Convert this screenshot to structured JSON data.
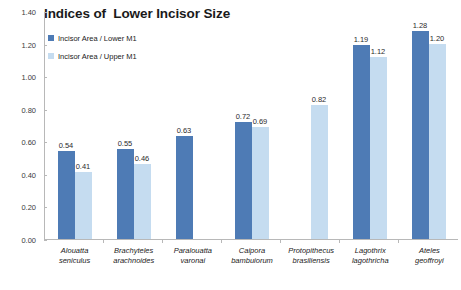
{
  "chart_data": {
    "type": "bar",
    "title": "Indices of  Lower Incisor Size",
    "xlabel": "",
    "ylabel": "",
    "ylim": [
      0.0,
      1.4
    ],
    "grid": false,
    "legend_position": "top-left",
    "y_ticks": [
      "0.00",
      "0.20",
      "0.40",
      "0.60",
      "0.80",
      "1.00",
      "1.20",
      "1.40"
    ],
    "categories": [
      {
        "genus": "Alouatta",
        "species": "seniculus"
      },
      {
        "genus": "Brachyteles",
        "species": "arachnoides"
      },
      {
        "genus": "Paralouatta",
        "species": "varonai"
      },
      {
        "genus": "Caipora",
        "species": "bambuiorum"
      },
      {
        "genus": "Protopithecus",
        "species": "brasiliensis"
      },
      {
        "genus": "Lagothrix",
        "species": "lagothricha"
      },
      {
        "genus": "Ateles",
        "species": "geoffroyi"
      }
    ],
    "series": [
      {
        "name": "Incisor Area / Lower M1",
        "color": "#4E7BB5",
        "values": [
          0.54,
          0.55,
          0.63,
          0.72,
          null,
          1.19,
          1.28
        ],
        "labels": [
          "0.54",
          "0.55",
          "0.63",
          "0.72",
          "",
          "1.19",
          "1.28"
        ]
      },
      {
        "name": "Incisor Area / Upper M1",
        "color": "#C5DCF0",
        "values": [
          0.41,
          0.46,
          null,
          0.69,
          0.82,
          1.12,
          1.2
        ],
        "labels": [
          "0.41",
          "0.46",
          "",
          "0.69",
          "0.82",
          "1.12",
          "1.20"
        ]
      }
    ]
  }
}
